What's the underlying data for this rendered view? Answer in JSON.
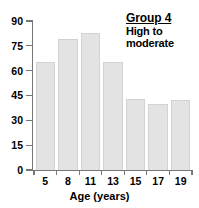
{
  "chart_data": {
    "type": "bar",
    "title": "Group 4",
    "subtitle_lines": [
      "High to",
      "moderate"
    ],
    "categories": [
      "5",
      "8",
      "11",
      "13",
      "15",
      "17",
      "19"
    ],
    "values": [
      65,
      79,
      83,
      65,
      43,
      40,
      42
    ],
    "xlabel": "Age (years)",
    "ylabel": "",
    "ylim": [
      0,
      90
    ],
    "yticks": [
      "0",
      "15",
      "30",
      "45",
      "60",
      "75",
      "90"
    ],
    "ytick_values": [
      0,
      15,
      30,
      45,
      60,
      75,
      90
    ],
    "grid": false,
    "legend": "none",
    "bar_color": "#e3e3e3",
    "bar_edge_color": "#d2d2d2",
    "axis_color": "#777777",
    "text_color": "#000000",
    "background": "#ffffff"
  }
}
